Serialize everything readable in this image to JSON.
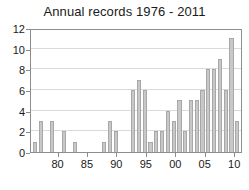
{
  "chart_data": {
    "type": "bar",
    "title": "Annual records 1976 - 2011",
    "xlabel": "",
    "ylabel": "",
    "ylim": [
      0,
      12
    ],
    "yticks": [
      0,
      2,
      4,
      6,
      8,
      10,
      12
    ],
    "xticks": [
      "80",
      "85",
      "90",
      "95",
      "00",
      "05",
      "10"
    ],
    "xtick_years": [
      1980,
      1985,
      1990,
      1995,
      2000,
      2005,
      2010
    ],
    "grid": true,
    "legend": null,
    "bar_color": "#c8c8c8",
    "bar_edge_color": "#a8a8a8",
    "axis_color": "#8d8d8d",
    "grid_color": "#d9d9e2",
    "categories": [
      "1976",
      "1977",
      "1978",
      "1979",
      "1980",
      "1981",
      "1982",
      "1983",
      "1984",
      "1985",
      "1986",
      "1987",
      "1988",
      "1989",
      "1990",
      "1991",
      "1992",
      "1993",
      "1994",
      "1995",
      "1996",
      "1997",
      "1998",
      "1999",
      "2000",
      "2001",
      "2002",
      "2003",
      "2004",
      "2005",
      "2006",
      "2007",
      "2008",
      "2009",
      "2010",
      "2011"
    ],
    "values": [
      1,
      3,
      0,
      3,
      0,
      2,
      0,
      1,
      0,
      0,
      0,
      0,
      1,
      3,
      2,
      0,
      0,
      6,
      7,
      6,
      1,
      2,
      2,
      4,
      3,
      5,
      2,
      5,
      5,
      6,
      8,
      8,
      9,
      6,
      11,
      3
    ]
  }
}
